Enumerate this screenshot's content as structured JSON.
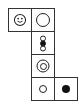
{
  "diagram": {
    "type": "cube-net",
    "cells": [
      {
        "row": 0,
        "col": 0,
        "symbol": "smiley-face"
      },
      {
        "row": 0,
        "col": 1,
        "symbol": "large-hollow-circle"
      },
      {
        "row": 1,
        "col": 1,
        "symbol": "vertical-three-circles-middle-filled"
      },
      {
        "row": 2,
        "col": 1,
        "symbol": "concentric-circles"
      },
      {
        "row": 3,
        "col": 1,
        "symbol": "small-hollow-circle"
      },
      {
        "row": 3,
        "col": 2,
        "symbol": "filled-dot"
      }
    ],
    "colors": {
      "stroke": "#222222",
      "fill": "#111111",
      "background": "#ffffff"
    }
  }
}
